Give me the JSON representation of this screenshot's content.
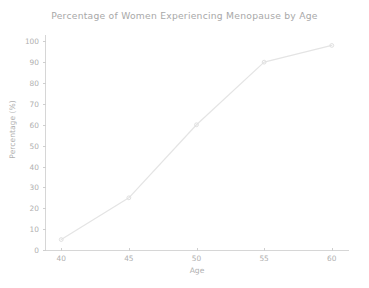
{
  "chart_data": {
    "type": "line",
    "title": "Percentage of Women Experiencing Menopause by Age",
    "xlabel": "Age",
    "ylabel": "Percentage (%)",
    "x": [
      40,
      45,
      50,
      55,
      60
    ],
    "values": [
      5,
      25,
      60,
      90,
      98
    ],
    "series": [
      {
        "name": "Percentage of Women Experiencing Menopause",
        "x": [
          40,
          45,
          50,
          55,
          60
        ],
        "values": [
          5,
          25,
          60,
          90,
          98
        ]
      }
    ],
    "xlim": [
      38.8,
      61.2
    ],
    "ylim": [
      0,
      103
    ],
    "xticks": [
      40,
      45,
      50,
      55,
      60
    ],
    "xtick_labels": [
      "40",
      "45",
      "50",
      "55",
      "60"
    ],
    "yticks": [
      0,
      10,
      20,
      30,
      40,
      50,
      60,
      70,
      80,
      90,
      100
    ],
    "ytick_labels": [
      "0",
      "10",
      "20",
      "30",
      "40",
      "50",
      "60",
      "70",
      "80",
      "90",
      "100"
    ],
    "grid": false,
    "legend": false,
    "legend_position": "none",
    "marker": "circle",
    "line_color": "#e4e4e4",
    "marker_color": "#e0e0e0",
    "axis_color": "#d6d6d6",
    "text_color": "#b0b0b0",
    "background_color": "#ffffff"
  }
}
